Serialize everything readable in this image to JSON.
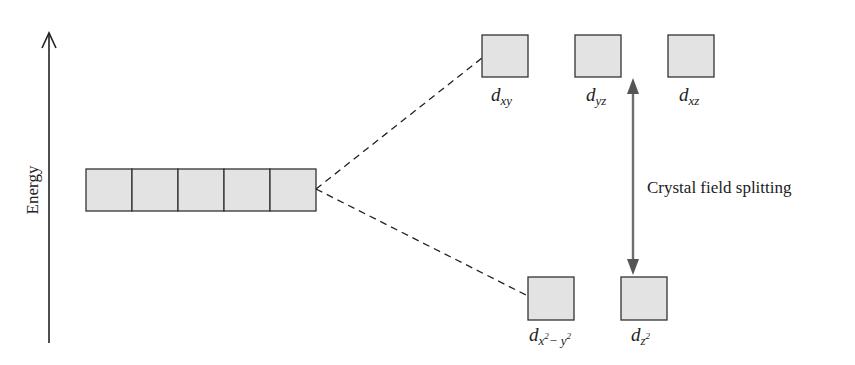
{
  "diagram": {
    "type": "energy-level-diagram",
    "axis": {
      "label": "Energy",
      "direction": "up"
    },
    "degenerate_set": {
      "box_count": 5
    },
    "upper_orbitals": [
      {
        "name": "d",
        "subscript": "xy"
      },
      {
        "name": "d",
        "subscript": "yz"
      },
      {
        "name": "d",
        "subscript": "xz"
      }
    ],
    "lower_orbitals": [
      {
        "name": "d",
        "subscript_html": "x<sup>2</sup>− y<sup>2</sup>",
        "subscript_text": "x²− y²"
      },
      {
        "name": "d",
        "subscript_html": "z<sup>2</sup>",
        "subscript_text": "z²"
      }
    ],
    "splitting_label": "Crystal field splitting",
    "colors": {
      "box_fill": "#e3e3e3",
      "box_stroke": "#333333",
      "arrow": "#6e6e6e",
      "line": "#222222"
    }
  }
}
